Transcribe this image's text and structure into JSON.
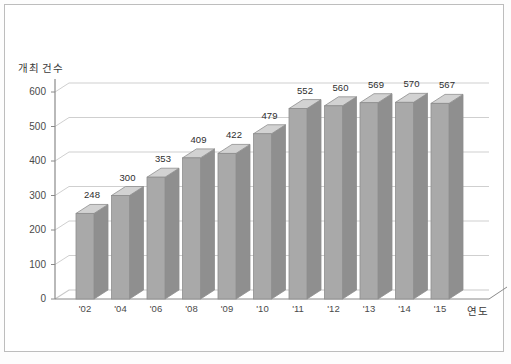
{
  "chart_data": {
    "type": "bar",
    "title": "",
    "subtitle": "",
    "xlabel": "연도",
    "ylabel": "개최 건수",
    "categories": [
      "'02",
      "'04",
      "'06",
      "'08",
      "'09",
      "'10",
      "'11",
      "'12",
      "'13",
      "'14",
      "'15"
    ],
    "values": [
      248,
      300,
      353,
      409,
      422,
      479,
      552,
      560,
      569,
      570,
      567
    ],
    "data_labels": [
      "248",
      "300",
      "353",
      "409",
      "422",
      "479",
      "552",
      "560",
      "569",
      "570",
      "567"
    ],
    "ylim": [
      0,
      600
    ],
    "ytick_values": [
      0,
      100,
      200,
      300,
      400,
      500,
      600
    ],
    "ytick_labels": [
      "0",
      "100",
      "200",
      "300",
      "400",
      "500",
      "600"
    ],
    "grid": true,
    "grid_axis": "y",
    "legend": false,
    "legend_position": "none",
    "three_d": true,
    "colors": {
      "bar_front": "#a9a9a9",
      "bar_side": "#8f8f8f",
      "bar_top": "#d2d2d2",
      "bar_outline": "#8e8e8e",
      "grid_line": "#c9c9c9",
      "axis_line": "#8a8a8a",
      "text": "#3a3a3a",
      "background": "#ffffff",
      "border": "#bdbdbd"
    }
  }
}
